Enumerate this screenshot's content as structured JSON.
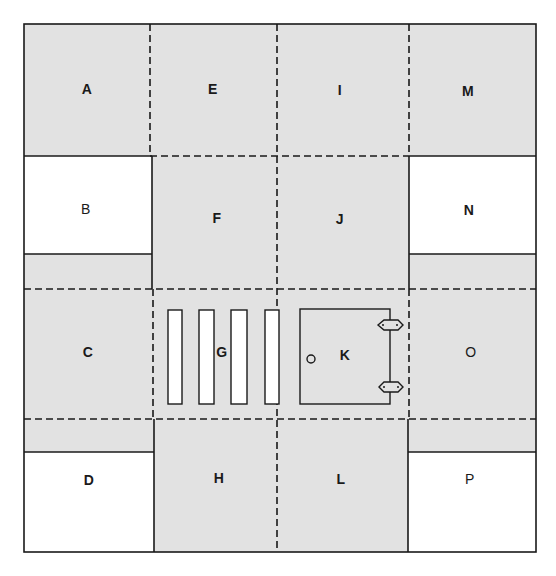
{
  "diagram": {
    "title": "",
    "colors": {
      "shaded": "#e2e2e2",
      "unshaded": "#ffffff",
      "line": "#1a1a1a"
    },
    "regions": [
      {
        "id": "A",
        "label": "A",
        "shaded": true
      },
      {
        "id": "B",
        "label": "B",
        "shaded": false
      },
      {
        "id": "C",
        "label": "C",
        "shaded": true
      },
      {
        "id": "D",
        "label": "D",
        "shaded": false
      },
      {
        "id": "E",
        "label": "E",
        "shaded": true
      },
      {
        "id": "F",
        "label": "F",
        "shaded": true
      },
      {
        "id": "G",
        "label": "G",
        "shaded": true
      },
      {
        "id": "H",
        "label": "H",
        "shaded": true
      },
      {
        "id": "I",
        "label": "I",
        "shaded": true
      },
      {
        "id": "J",
        "label": "J",
        "shaded": true
      },
      {
        "id": "K",
        "label": "K",
        "shaded": true
      },
      {
        "id": "L",
        "label": "L",
        "shaded": true
      },
      {
        "id": "M",
        "label": "M",
        "shaded": true
      },
      {
        "id": "N",
        "label": "N",
        "shaded": false
      },
      {
        "id": "O",
        "label": "O",
        "shaded": true
      },
      {
        "id": "P",
        "label": "P",
        "shaded": false
      }
    ],
    "objects": {
      "G_bars": 4,
      "K_box_small_circle": "o",
      "K_box_handles": 2
    }
  }
}
